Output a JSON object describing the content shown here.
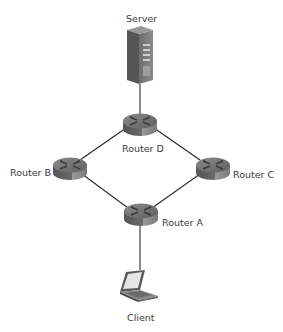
{
  "diagram": {
    "type": "network-topology",
    "nodes": [
      {
        "id": "server",
        "label": "Server",
        "kind": "server",
        "icon": "server-tower-icon"
      },
      {
        "id": "routerD",
        "label": "Router D",
        "kind": "router",
        "icon": "router-icon"
      },
      {
        "id": "routerB",
        "label": "Router B",
        "kind": "router",
        "icon": "router-icon"
      },
      {
        "id": "routerC",
        "label": "Router C",
        "kind": "router",
        "icon": "router-icon"
      },
      {
        "id": "routerA",
        "label": "Router A",
        "kind": "router",
        "icon": "router-icon"
      },
      {
        "id": "client",
        "label": "Client",
        "kind": "laptop",
        "icon": "laptop-icon"
      }
    ],
    "edges": [
      {
        "from": "server",
        "to": "routerD"
      },
      {
        "from": "routerD",
        "to": "routerB"
      },
      {
        "from": "routerD",
        "to": "routerC"
      },
      {
        "from": "routerB",
        "to": "routerA"
      },
      {
        "from": "routerC",
        "to": "routerA"
      },
      {
        "from": "routerA",
        "to": "client"
      }
    ],
    "colors": {
      "line": "#2b2b2b",
      "device_dark": "#4a4a4a",
      "device_mid": "#7a7a7a",
      "device_light": "#a8a8a8",
      "label": "#3a3a3a"
    }
  }
}
